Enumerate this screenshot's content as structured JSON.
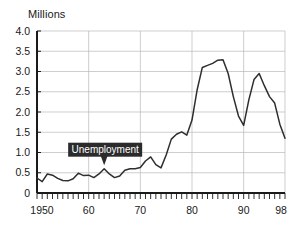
{
  "chart_data": {
    "type": "line",
    "title": "",
    "ylabel": "Millions",
    "xlabel": "",
    "ylim": [
      0,
      4.0
    ],
    "xlim": [
      1950,
      1998
    ],
    "grid": true,
    "legend_position": "none",
    "y_ticks": [
      "0",
      "0.5",
      "1.0",
      "1.5",
      "2.0",
      "2.5",
      "3.0",
      "3.5",
      "4.0"
    ],
    "y_tick_values": [
      0,
      0.5,
      1.0,
      1.5,
      2.0,
      2.5,
      3.0,
      3.5,
      4.0
    ],
    "x_ticks": [
      "1950",
      "60",
      "70",
      "80",
      "90",
      "98"
    ],
    "x_tick_values": [
      1950,
      1960,
      1970,
      1980,
      1990,
      1998
    ],
    "annotations": [
      {
        "text": "Unemployment",
        "points_to_x": 1963,
        "points_to_y": 0.6,
        "style": "dark-callout"
      }
    ],
    "series": [
      {
        "name": "Unemployment",
        "color": "#2e2e2e",
        "x": [
          1950,
          1951,
          1952,
          1953,
          1954,
          1955,
          1956,
          1957,
          1958,
          1959,
          1960,
          1961,
          1962,
          1963,
          1964,
          1965,
          1966,
          1967,
          1968,
          1969,
          1970,
          1971,
          1972,
          1973,
          1974,
          1975,
          1976,
          1977,
          1978,
          1979,
          1980,
          1981,
          1982,
          1983,
          1984,
          1985,
          1986,
          1987,
          1988,
          1989,
          1990,
          1991,
          1992,
          1993,
          1994,
          1995,
          1996,
          1997,
          1998
        ],
        "values": [
          0.37,
          0.28,
          0.47,
          0.44,
          0.36,
          0.31,
          0.3,
          0.35,
          0.49,
          0.43,
          0.44,
          0.38,
          0.47,
          0.6,
          0.47,
          0.38,
          0.42,
          0.56,
          0.6,
          0.6,
          0.63,
          0.79,
          0.89,
          0.7,
          0.62,
          0.94,
          1.33,
          1.45,
          1.51,
          1.43,
          1.8,
          2.55,
          3.1,
          3.15,
          3.2,
          3.28,
          3.29,
          2.95,
          2.38,
          1.9,
          1.67,
          2.3,
          2.8,
          2.95,
          2.65,
          2.38,
          2.22,
          1.7,
          1.35
        ]
      }
    ]
  }
}
